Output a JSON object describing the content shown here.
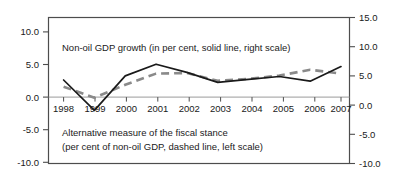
{
  "chart_data": {
    "type": "line",
    "title": "",
    "xlabel": "",
    "categories": [
      "1998",
      "1999",
      "2000",
      "2001",
      "2002",
      "2003",
      "2004",
      "2005",
      "2006",
      "2007"
    ],
    "grid": false,
    "legend_position": "inside-annotations",
    "left_axis": {
      "label": "Alternative measure of the fiscal stance (per cent of non-oil GDP)",
      "ylim": [
        -10.0,
        10.0
      ],
      "ticks": [
        10.0,
        5.0,
        0.0,
        -5.0,
        -10.0
      ],
      "ticklabels": [
        "10.0",
        "5.0",
        "0.0",
        "-5.0",
        "-10.0"
      ]
    },
    "right_axis": {
      "label": "Non-oil GDP growth (in per cent)",
      "ylim": [
        -10.0,
        15.0
      ],
      "ticks": [
        15.0,
        10.0,
        5.0,
        0.0,
        -5.0,
        -10.0
      ],
      "ticklabels": [
        "15.0",
        "10.0",
        "5.0",
        "0.0",
        "-5.0",
        "-10.0"
      ]
    },
    "series": [
      {
        "name": "Non-oil GDP growth (in per cent, solid line, right scale)",
        "axis": "right",
        "style": "solid",
        "color": "#1a1a1a",
        "values": [
          4.3,
          -0.9,
          5.0,
          7.0,
          5.6,
          3.9,
          4.4,
          4.9,
          4.1,
          6.6
        ]
      },
      {
        "name": "Alternative measure of the fiscal stance (per cent of non-oil GDP, dashed line, left scale)",
        "axis": "left",
        "style": "dashed",
        "color": "#8a8a8a",
        "values": [
          1.6,
          -0.1,
          1.9,
          3.6,
          3.7,
          2.5,
          2.8,
          3.3,
          4.2,
          3.6
        ]
      }
    ],
    "annotations": [
      {
        "name": "solid-series-annotation",
        "text": "Non-oil GDP growth (in per cent, solid line, right scale)"
      },
      {
        "name": "dashed-series-annotation-line1",
        "text": "Alternative measure of the fiscal stance"
      },
      {
        "name": "dashed-series-annotation-line2",
        "text": "(per cent of non-oil GDP, dashed line, left scale)"
      }
    ]
  },
  "left_ticks": {
    "t0": "10.0",
    "t1": "5.0",
    "t2": "0.0",
    "t3": "-5.0",
    "t4": "-10.0"
  },
  "right_ticks": {
    "t0": "15.0",
    "t1": "10.0",
    "t2": "5.0",
    "t3": "0.0",
    "t4": "-5.0",
    "t5": "-10.0"
  },
  "years": {
    "y0": "1998",
    "y1": "1999",
    "y2": "2000",
    "y3": "2001",
    "y4": "2002",
    "y5": "2003",
    "y6": "2004",
    "y7": "2005",
    "y8": "2006",
    "y9": "2007"
  },
  "annotations": {
    "solid": "Non-oil GDP growth (in per cent, solid line, right scale)",
    "dashed_line1": "Alternative measure of the fiscal stance",
    "dashed_line2": "(per cent of non-oil GDP, dashed line, left scale)"
  },
  "colors": {
    "solid_line": "#1a1a1a",
    "dashed_line": "#8a8a8a",
    "frame": "#4d4d4d",
    "zero_line": "#9a9a9a",
    "background": "#ffffff"
  }
}
